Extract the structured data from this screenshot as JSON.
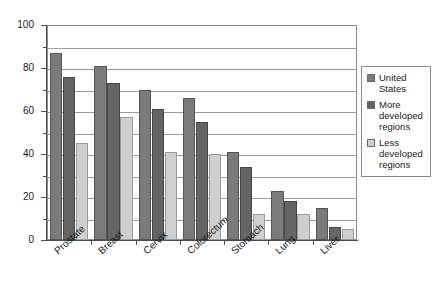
{
  "chart_data": {
    "type": "bar",
    "title": "",
    "subtitle": "",
    "xlabel": "",
    "ylabel": "",
    "ylim": [
      0,
      100
    ],
    "ytick_labels": [
      "0",
      "20",
      "40",
      "60",
      "80",
      "100"
    ],
    "ytick_values": [
      0,
      20,
      40,
      60,
      80,
      100
    ],
    "yminor_values": [
      10,
      30,
      50,
      70,
      90
    ],
    "grid": "horizontal",
    "legend_position": "right",
    "categories": [
      "Prostate",
      "Breast",
      "Cervix",
      "Colorectum",
      "Stomach",
      "Lung",
      "Liver"
    ],
    "series": [
      {
        "name": "United States",
        "color": "#7b7b7b",
        "values": [
          87,
          81,
          70,
          66,
          41,
          23,
          15
        ]
      },
      {
        "name": "More developed regions",
        "color": "#646464",
        "values": [
          76,
          73,
          61,
          55,
          34,
          18,
          6
        ]
      },
      {
        "name": "Less developed regions",
        "color": "#cfcfcf",
        "values": [
          45,
          57,
          41,
          40,
          12,
          12,
          5
        ]
      }
    ]
  },
  "legend": {
    "items": [
      {
        "label": "United States",
        "swatch_name": "legend-swatch-united-states"
      },
      {
        "label": "More developed regions",
        "swatch_name": "legend-swatch-more-developed-regions"
      },
      {
        "label": "Less developed regions",
        "swatch_name": "legend-swatch-less-developed-regions"
      }
    ]
  }
}
